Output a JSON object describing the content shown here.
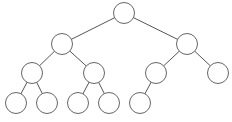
{
  "diagram": {
    "type": "binary-tree",
    "style": {
      "stroke": "#666666",
      "edge": "#555555",
      "fill": "#ffffff",
      "radius": 10.5
    },
    "nodes": [
      {
        "id": "n0",
        "x": 124,
        "y": 13
      },
      {
        "id": "n1",
        "x": 62,
        "y": 44
      },
      {
        "id": "n2",
        "x": 187,
        "y": 44
      },
      {
        "id": "n3",
        "x": 32,
        "y": 73
      },
      {
        "id": "n4",
        "x": 94,
        "y": 73
      },
      {
        "id": "n5",
        "x": 156,
        "y": 73
      },
      {
        "id": "n6",
        "x": 218,
        "y": 73
      },
      {
        "id": "n7",
        "x": 16,
        "y": 103
      },
      {
        "id": "n8",
        "x": 47,
        "y": 103
      },
      {
        "id": "n9",
        "x": 78,
        "y": 103
      },
      {
        "id": "n10",
        "x": 109,
        "y": 103
      },
      {
        "id": "n11",
        "x": 140,
        "y": 103
      }
    ],
    "edges": [
      [
        "n0",
        "n1"
      ],
      [
        "n0",
        "n2"
      ],
      [
        "n1",
        "n3"
      ],
      [
        "n1",
        "n4"
      ],
      [
        "n2",
        "n5"
      ],
      [
        "n2",
        "n6"
      ],
      [
        "n3",
        "n7"
      ],
      [
        "n3",
        "n8"
      ],
      [
        "n4",
        "n9"
      ],
      [
        "n4",
        "n10"
      ],
      [
        "n5",
        "n11"
      ]
    ]
  }
}
